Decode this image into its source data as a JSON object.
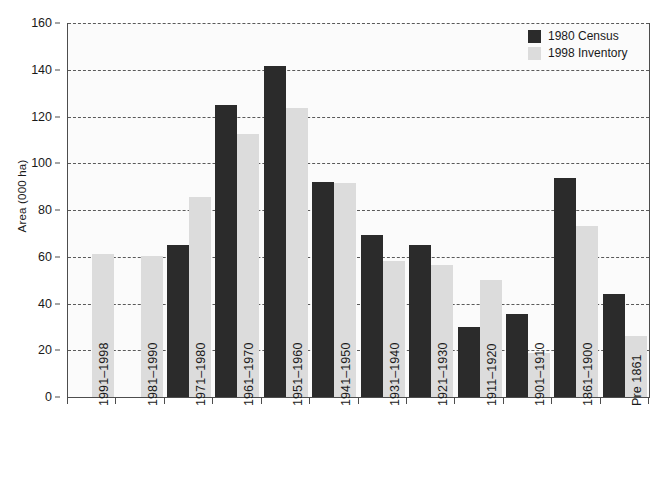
{
  "chart_data": {
    "type": "bar",
    "title": "",
    "xlabel": "",
    "ylabel": "Area (000 ha)",
    "ylim": [
      0,
      160
    ],
    "ytick_step": 20,
    "yticks": [
      0,
      20,
      40,
      60,
      80,
      100,
      120,
      140,
      160
    ],
    "grid": "horizontal-dashed",
    "legend_position": "top-right",
    "categories": [
      "1991–1998",
      "1981–1990",
      "1971–1980",
      "1961–1970",
      "1951–1960",
      "1941–1950",
      "1931–1940",
      "1921–1930",
      "1911–1920",
      "1901–1910",
      "1861–1900",
      "Pre 1861"
    ],
    "series": [
      {
        "name": "1980 Census",
        "color": "#2b2b2b",
        "values": [
          null,
          null,
          65,
          125,
          141.5,
          92,
          69.5,
          65,
          30,
          35.5,
          93.5,
          44
        ]
      },
      {
        "name": "1998 Inventory",
        "color": "#dcdcdc",
        "values": [
          61,
          60.5,
          85.5,
          112.5,
          123.5,
          91.5,
          58,
          56.5,
          50,
          19,
          73,
          26
        ]
      }
    ]
  },
  "legend": {
    "entries": [
      {
        "label": "1980 Census"
      },
      {
        "label": "1998 Inventory"
      }
    ]
  },
  "axes": {
    "y_title": "Area (000 ha)"
  }
}
